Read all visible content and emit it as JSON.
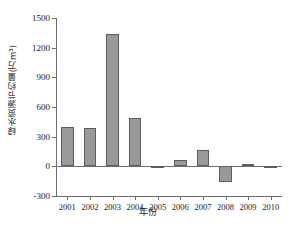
{
  "chart_data": {
    "type": "bar",
    "title": "",
    "categories": [
      "2001",
      "2002",
      "2003",
      "2004",
      "2005",
      "2006",
      "2007",
      "2008",
      "2009",
      "2010"
    ],
    "values": [
      400,
      385,
      1340,
      490,
      -10,
      60,
      170,
      -155,
      25,
      -15
    ],
    "series": [
      {
        "name": "绿水资源节约量",
        "values": [
          400,
          385,
          1340,
          490,
          -10,
          60,
          170,
          -155,
          25,
          -15
        ]
      }
    ],
    "xlabel": "年份",
    "ylabel": "绿水资源节约量(万m³)",
    "ylim": [
      -300,
      1500
    ],
    "yticks": [
      -300,
      0,
      300,
      600,
      900,
      1200,
      1500
    ],
    "ytick_labels": [
      "-300",
      "0",
      "300",
      "600",
      "900",
      "1200",
      "1500"
    ],
    "grid": false,
    "legend": false,
    "bar_color": "#999999",
    "bar_edge_color": "#5d5d5d",
    "axis_color": "#6e6e6e",
    "background": "#ffffff"
  }
}
